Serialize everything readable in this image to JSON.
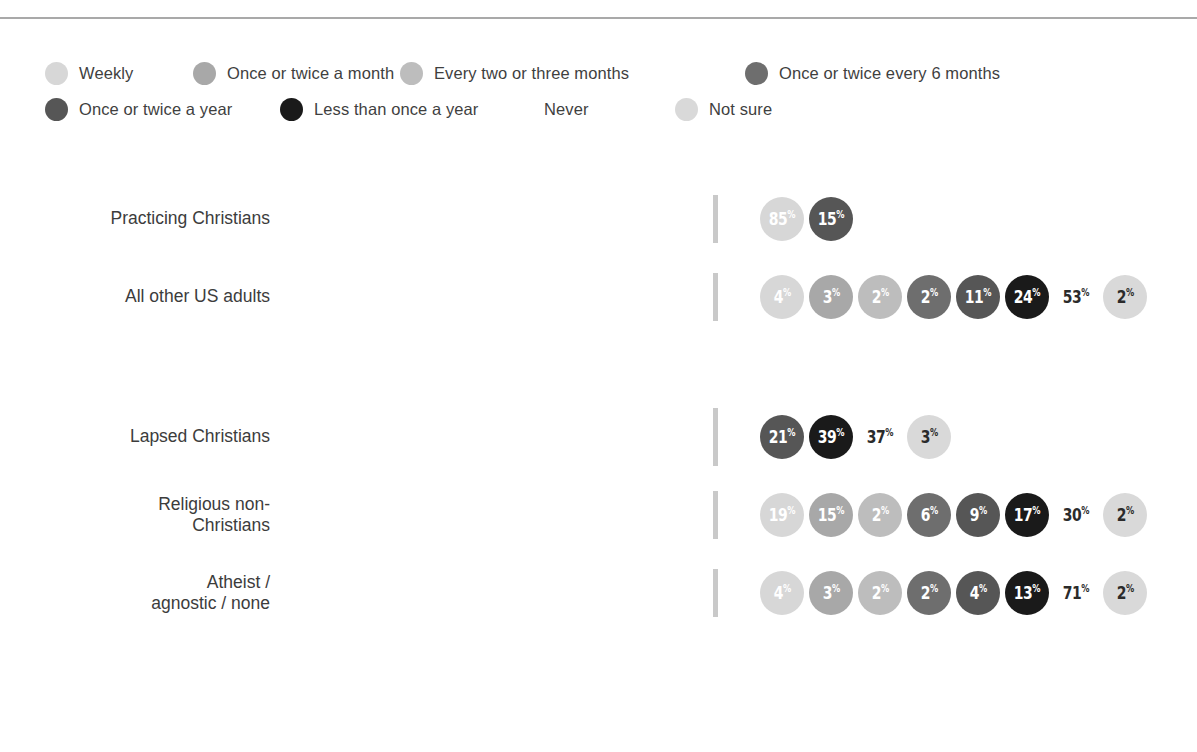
{
  "colors": {
    "weekly": "#d7d7d7",
    "once_twice_month": "#a8a8a8",
    "every_two_three_months": "#bdbdbd",
    "once_twice_6_months": "#6e6e6e",
    "once_twice_year": "#565656",
    "less_than_once_year": "#1a1a1a",
    "never": "#ffffff",
    "not_sure": "#d9d9d9",
    "rule": "#a9a9a9",
    "tick": "#c9c9c9",
    "text": "#3c3c3c",
    "bubble_text_light": "#ffffff",
    "bubble_text_dark": "#2b2b2b"
  },
  "legend": {
    "rows": [
      [
        {
          "label": "Weekly",
          "key": "weekly"
        },
        {
          "label": "Once or twice a month",
          "key": "once_twice_month"
        },
        {
          "label": "Every two or three months",
          "key": "every_two_three_months"
        },
        {
          "label": "Once or twice every 6 months",
          "key": "once_twice_6_months"
        }
      ],
      [
        {
          "label": "Once or twice a year",
          "key": "once_twice_year"
        },
        {
          "label": "Less than once a year",
          "key": "less_than_once_year"
        },
        {
          "label": "Never",
          "key": "never"
        },
        {
          "label": "Not sure",
          "key": "not_sure"
        }
      ]
    ]
  },
  "chart_data": {
    "type": "bar",
    "title": "",
    "xlabel": "",
    "ylabel": "",
    "orientation": "horizontal",
    "stacked": true,
    "xlim": [
      0,
      100
    ],
    "grid": false,
    "legend_position": "top",
    "categories": [
      "Practicing Christians",
      "All other US adults",
      "Lapsed Christians",
      "Religious non-\nChristians",
      "Atheist /\nagnostic / none"
    ],
    "series": [
      {
        "name": "Weekly",
        "key": "weekly",
        "values": [
          85,
          4,
          0,
          19,
          4
        ]
      },
      {
        "name": "Once or twice a month",
        "key": "once_twice_month",
        "values": [
          0,
          3,
          0,
          15,
          3
        ]
      },
      {
        "name": "Every two or three months",
        "key": "every_two_three_months",
        "values": [
          0,
          2,
          0,
          2,
          2
        ]
      },
      {
        "name": "Once or twice every 6 months",
        "key": "once_twice_6_months",
        "values": [
          0,
          2,
          0,
          6,
          2
        ]
      },
      {
        "name": "Once or twice a year",
        "key": "once_twice_year",
        "values": [
          15,
          11,
          21,
          9,
          4
        ]
      },
      {
        "name": "Less than once a year",
        "key": "less_than_once_year",
        "values": [
          0,
          24,
          39,
          17,
          13
        ]
      },
      {
        "name": "Never",
        "key": "never",
        "values": [
          0,
          53,
          37,
          30,
          71
        ]
      },
      {
        "name": "Not sure",
        "key": "not_sure",
        "values": [
          0,
          2,
          3,
          2,
          2
        ]
      }
    ],
    "rows": [
      {
        "label": "Practicing Christians",
        "tick": "short",
        "segments": [
          {
            "key": "weekly",
            "value": 85
          },
          {
            "key": "once_twice_year",
            "value": 15
          }
        ],
        "bubbles": [
          {
            "key": "weekly",
            "value": "85",
            "unit": "%"
          },
          {
            "key": "once_twice_year",
            "value": "15",
            "unit": "%"
          }
        ]
      },
      {
        "label": "All other US adults",
        "tick": "short",
        "segments": [
          {
            "key": "weekly",
            "value": 4
          },
          {
            "key": "once_twice_month",
            "value": 3
          },
          {
            "key": "every_two_three_months",
            "value": 2
          },
          {
            "key": "once_twice_6_months",
            "value": 2
          },
          {
            "key": "once_twice_year",
            "value": 11
          },
          {
            "key": "less_than_once_year",
            "value": 24
          },
          {
            "key": "never",
            "value": 53
          },
          {
            "key": "not_sure",
            "value": 2
          }
        ],
        "bubbles": [
          {
            "key": "weekly",
            "value": "4",
            "unit": "%"
          },
          {
            "key": "once_twice_month",
            "value": "3",
            "unit": "%"
          },
          {
            "key": "every_two_three_months",
            "value": "2",
            "unit": "%"
          },
          {
            "key": "once_twice_6_months",
            "value": "2",
            "unit": "%"
          },
          {
            "key": "once_twice_year",
            "value": "11",
            "unit": "%"
          },
          {
            "key": "less_than_once_year",
            "value": "24",
            "unit": "%"
          },
          {
            "key": "never",
            "value": "53",
            "unit": "%"
          },
          {
            "key": "not_sure",
            "value": "2",
            "unit": "%"
          }
        ]
      },
      {
        "label": "Lapsed Christians",
        "tick": "tall",
        "segments": [
          {
            "key": "once_twice_year",
            "value": 21
          },
          {
            "key": "less_than_once_year",
            "value": 39
          },
          {
            "key": "never",
            "value": 37
          },
          {
            "key": "not_sure",
            "value": 3
          }
        ],
        "bubbles": [
          {
            "key": "once_twice_year",
            "value": "21",
            "unit": "%"
          },
          {
            "key": "less_than_once_year",
            "value": "39",
            "unit": "%"
          },
          {
            "key": "never",
            "value": "37",
            "unit": "%"
          },
          {
            "key": "not_sure",
            "value": "3",
            "unit": "%"
          }
        ]
      },
      {
        "label": "Religious non-\nChristians",
        "tick": "short",
        "segments": [
          {
            "key": "weekly",
            "value": 19
          },
          {
            "key": "once_twice_month",
            "value": 15
          },
          {
            "key": "every_two_three_months",
            "value": 2
          },
          {
            "key": "once_twice_6_months",
            "value": 6
          },
          {
            "key": "once_twice_year",
            "value": 9
          },
          {
            "key": "less_than_once_year",
            "value": 17
          },
          {
            "key": "never",
            "value": 30
          },
          {
            "key": "not_sure",
            "value": 2
          }
        ],
        "bubbles": [
          {
            "key": "weekly",
            "value": "19",
            "unit": "%"
          },
          {
            "key": "once_twice_month",
            "value": "15",
            "unit": "%"
          },
          {
            "key": "every_two_three_months",
            "value": "2",
            "unit": "%"
          },
          {
            "key": "once_twice_6_months",
            "value": "6",
            "unit": "%"
          },
          {
            "key": "once_twice_year",
            "value": "9",
            "unit": "%"
          },
          {
            "key": "less_than_once_year",
            "value": "17",
            "unit": "%"
          },
          {
            "key": "never",
            "value": "30",
            "unit": "%"
          },
          {
            "key": "not_sure",
            "value": "2",
            "unit": "%"
          }
        ]
      },
      {
        "label": "Atheist /\nagnostic / none",
        "tick": "short",
        "segments": [
          {
            "key": "weekly",
            "value": 4
          },
          {
            "key": "once_twice_month",
            "value": 3
          },
          {
            "key": "every_two_three_months",
            "value": 2
          },
          {
            "key": "once_twice_6_months",
            "value": 2
          },
          {
            "key": "once_twice_year",
            "value": 4
          },
          {
            "key": "less_than_once_year",
            "value": 13
          },
          {
            "key": "never",
            "value": 71
          },
          {
            "key": "not_sure",
            "value": 2
          }
        ],
        "bubbles": [
          {
            "key": "weekly",
            "value": "4",
            "unit": "%"
          },
          {
            "key": "once_twice_month",
            "value": "3",
            "unit": "%"
          },
          {
            "key": "every_two_three_months",
            "value": "2",
            "unit": "%"
          },
          {
            "key": "once_twice_6_months",
            "value": "2",
            "unit": "%"
          },
          {
            "key": "once_twice_year",
            "value": "4",
            "unit": "%"
          },
          {
            "key": "less_than_once_year",
            "value": "13",
            "unit": "%"
          },
          {
            "key": "never",
            "value": "71",
            "unit": "%"
          },
          {
            "key": "not_sure",
            "value": "2",
            "unit": "%"
          }
        ]
      }
    ]
  }
}
